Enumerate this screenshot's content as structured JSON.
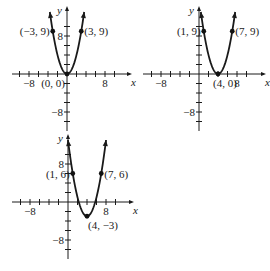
{
  "chart_data": [
    {
      "type": "line",
      "title": "",
      "xlabel": "x",
      "ylabel": "y",
      "function": "y = x^2",
      "vertex": [
        0,
        0
      ],
      "xlim": [
        -12,
        13
      ],
      "ylim": [
        -12,
        14
      ],
      "tick_step": 2,
      "x_tick_labels": [
        {
          "value": -8,
          "text": "-8"
        },
        {
          "value": 8,
          "text": "8"
        }
      ],
      "y_tick_labels": [
        {
          "value": 8,
          "text": "8"
        },
        {
          "value": -8,
          "text": "-8"
        }
      ],
      "points": [
        {
          "x": -3,
          "y": 9,
          "label": "(-3, 9)",
          "anchor": "left"
        },
        {
          "x": 3,
          "y": 9,
          "label": "(3, 9)",
          "anchor": "right"
        },
        {
          "x": 0,
          "y": 0,
          "label": "(0, 0)",
          "anchor": "below-left"
        }
      ]
    },
    {
      "type": "line",
      "title": "",
      "xlabel": "x",
      "ylabel": "y",
      "function": "y = (x - 4)^2",
      "vertex": [
        4,
        0
      ],
      "xlim": [
        -12,
        13
      ],
      "ylim": [
        -12,
        14
      ],
      "tick_step": 2,
      "x_tick_labels": [
        {
          "value": -8,
          "text": "-8"
        },
        {
          "value": 8,
          "text": "8"
        }
      ],
      "y_tick_labels": [
        {
          "value": -8,
          "text": "-8"
        }
      ],
      "points": [
        {
          "x": 1,
          "y": 9,
          "label": "(1, 9)",
          "anchor": "left"
        },
        {
          "x": 7,
          "y": 9,
          "label": "(7, 9)",
          "anchor": "right"
        },
        {
          "x": 4,
          "y": 0,
          "label": "(4, 0)",
          "anchor": "below"
        }
      ]
    },
    {
      "type": "line",
      "title": "",
      "xlabel": "x",
      "ylabel": "y",
      "function": "y = (x - 4)^2 - 3",
      "vertex": [
        4,
        -3
      ],
      "xlim": [
        -12,
        13
      ],
      "ylim": [
        -12,
        14
      ],
      "tick_step": 2,
      "x_tick_labels": [
        {
          "value": -8,
          "text": "-8"
        },
        {
          "value": 8,
          "text": "8"
        }
      ],
      "y_tick_labels": [
        {
          "value": 8,
          "text": "8"
        },
        {
          "value": -8,
          "text": "-8"
        }
      ],
      "points": [
        {
          "x": 1,
          "y": 6,
          "label": "(1, 6)",
          "anchor": "left"
        },
        {
          "x": 7,
          "y": 6,
          "label": "(7, 6)",
          "anchor": "right"
        },
        {
          "x": 4,
          "y": -3,
          "label": "(4, -3)",
          "anchor": "below-right"
        }
      ]
    }
  ]
}
